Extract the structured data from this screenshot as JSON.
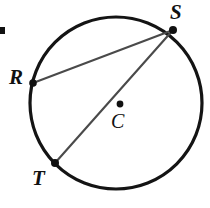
{
  "figure": {
    "kind": "circle-geometry-diagram",
    "canvas": {
      "width": 210,
      "height": 208,
      "background": "#ffffff"
    },
    "circle": {
      "name": "main-circle",
      "cx": 116,
      "cy": 103,
      "r": 86,
      "stroke": "#141414",
      "stroke_width": 3.2,
      "fill": "none"
    },
    "center_point": {
      "label": "C",
      "dot_x": 120,
      "dot_y": 104,
      "dot_r": 3.4,
      "dot_color": "#111111",
      "label_x": 111,
      "label_y": 111
    },
    "points": [
      {
        "label": "S",
        "x": 173,
        "y": 30,
        "dot_r": 4.0,
        "dot_color": "#111111",
        "label_x": 170,
        "label_y": 2
      },
      {
        "label": "R",
        "x": 33,
        "y": 83,
        "dot_r": 3.8,
        "dot_color": "#111111",
        "label_x": 9,
        "label_y": 67
      },
      {
        "label": "T",
        "x": 55,
        "y": 163,
        "dot_r": 4.0,
        "dot_color": "#111111",
        "label_x": 32,
        "label_y": 168
      }
    ],
    "chords": [
      {
        "name": "chord-RS",
        "from": "R",
        "to": "S",
        "x1": 33,
        "y1": 83,
        "x2": 173,
        "y2": 30,
        "stroke": "#4a4a4a",
        "stroke_width": 2.1
      },
      {
        "name": "chord-TS",
        "from": "T",
        "to": "S",
        "x1": 55,
        "y1": 163,
        "x2": 173,
        "y2": 30,
        "stroke": "#4a4a4a",
        "stroke_width": 2.1
      }
    ],
    "artifact_mark": {
      "name": "edge-bullet-mark",
      "x": 0,
      "y": 27,
      "width": 5,
      "height": 7,
      "color": "#111111"
    }
  }
}
